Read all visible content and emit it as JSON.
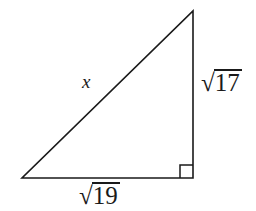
{
  "figure": {
    "background_color": "#ffffff",
    "stroke_color": "#1a1a1a",
    "stroke_width": 1.6
  },
  "geometry": {
    "vertices": {
      "left": [
        22,
        178
      ],
      "bottom_right": [
        193,
        178
      ],
      "apex": [
        193,
        11
      ]
    },
    "right_angle_marker": {
      "at_vertex": "bottom_right",
      "size": 13
    }
  },
  "labels": {
    "hypotenuse": {
      "text": "x",
      "style": "italic"
    },
    "vertical_leg": {
      "radical_sign": "√",
      "radicand": "17",
      "full_text": "√17"
    },
    "horizontal_leg": {
      "radical_sign": "√",
      "radicand": "19",
      "full_text": "√19"
    }
  }
}
